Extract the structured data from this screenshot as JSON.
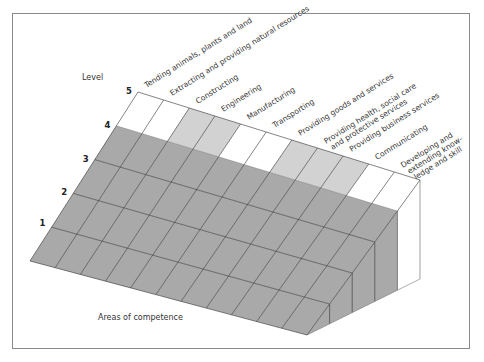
{
  "diagram": {
    "y_axis_title": "Level",
    "x_axis_title": "Areas of competence",
    "levels": [
      "1",
      "2",
      "3",
      "4",
      "5"
    ],
    "areas": [
      {
        "label": [
          "Tending animals, plants and land"
        ],
        "level5_shade": "white"
      },
      {
        "label": [
          "Extracting and providing natural resources"
        ],
        "level5_shade": "white"
      },
      {
        "label": [
          "Constructing"
        ],
        "level5_shade": "light"
      },
      {
        "label": [
          "Engineering"
        ],
        "level5_shade": "light"
      },
      {
        "label": [
          "Manufacturing"
        ],
        "level5_shade": "white"
      },
      {
        "label": [
          "Transporting"
        ],
        "level5_shade": "white"
      },
      {
        "label": [
          "Providing goods and services"
        ],
        "level5_shade": "light"
      },
      {
        "label": [
          "Providing health, social care",
          "and protective services"
        ],
        "level5_shade": "light"
      },
      {
        "label": [
          "Providing business services"
        ],
        "level5_shade": "light"
      },
      {
        "label": [
          "Communicating"
        ],
        "level5_shade": "white"
      },
      {
        "label": [
          "Developing and",
          "extending know-",
          "ledge and skill"
        ],
        "level5_shade": "white"
      }
    ],
    "colors": {
      "dark_fill": "#a9a9a9",
      "light_fill": "#d2d2d2",
      "white_fill": "#ffffff",
      "line": "#333333",
      "frame": "#8a8a8a"
    },
    "geometry": {
      "back_left": [
        138,
        92
      ],
      "back_right": [
        420,
        180
      ],
      "front_left": [
        30,
        261
      ],
      "front_right": [
        307,
        335
      ],
      "bottom_right": [
        420,
        279
      ]
    }
  }
}
